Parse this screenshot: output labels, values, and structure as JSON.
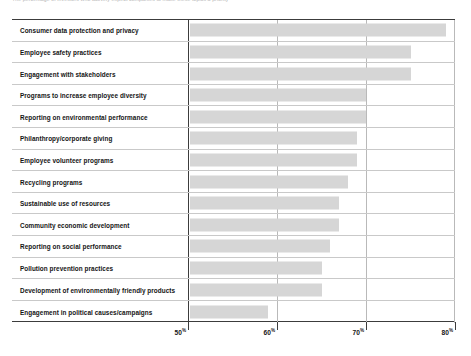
{
  "caption": "The percentage of investors who actively expect companies to make these topics a priority",
  "chart_data": {
    "type": "bar",
    "orientation": "horizontal",
    "title": "",
    "xlabel": "",
    "ylabel": "",
    "xlim": [
      47,
      80
    ],
    "xticks": [
      50,
      60,
      70,
      80
    ],
    "xticklabels": [
      "50%",
      "60%",
      "70%",
      "80%"
    ],
    "grid": true,
    "legend": false,
    "bar_color": "#d6d6d6",
    "categories": [
      "Consumer data protection and privacy",
      "Employee safety practices",
      "Engagement with stakeholders",
      "Programs to increase employee diversity",
      "Reporting on environmental performance",
      "Philanthropy/corporate giving",
      "Employee volunteer programs",
      "Recycling programs",
      "Sustainable use of resources",
      "Community economic development",
      "Reporting on social performance",
      "Pollution prevention practices",
      "Development of environmentally friendly products",
      "Engagement in political causes/campaigns"
    ],
    "values": [
      79,
      75,
      75,
      70,
      70,
      69,
      69,
      68,
      67,
      67,
      66,
      65,
      65,
      59
    ]
  },
  "axis": {
    "ticks": [
      {
        "label": "50",
        "pct": "%",
        "value": 50
      },
      {
        "label": "60",
        "pct": "%",
        "value": 60
      },
      {
        "label": "70",
        "pct": "%",
        "value": 70
      },
      {
        "label": "80",
        "pct": "%",
        "value": 80
      }
    ]
  }
}
